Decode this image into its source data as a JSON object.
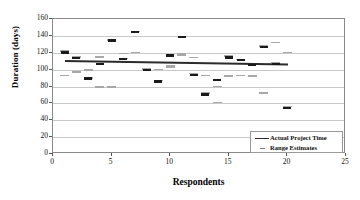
{
  "chart_data": {
    "type": "scatter",
    "title": "",
    "xlabel": "Respondents",
    "ylabel": "Duration (days)",
    "xlim": [
      0,
      25
    ],
    "ylim": [
      0,
      160
    ],
    "xticks": [
      0,
      5,
      10,
      15,
      20,
      25
    ],
    "yticks": [
      0,
      20,
      40,
      60,
      80,
      100,
      120,
      140,
      160
    ],
    "grid": "horizontal",
    "legend_position": "lower-right",
    "x": [
      1,
      2,
      3,
      4,
      5,
      6,
      7,
      8,
      9,
      10,
      11,
      12,
      13,
      14,
      15,
      16,
      17,
      18,
      19,
      20
    ],
    "series": [
      {
        "name": "Actual Project Time",
        "marker": "horizontal-dash-dark",
        "values": [
          121,
          114,
          90,
          107,
          135,
          113,
          145,
          100,
          86,
          117,
          139,
          94,
          71,
          88,
          115,
          112,
          106,
          127,
          107,
          55
        ]
      },
      {
        "name": "Range Estimates (upper)",
        "marker": "horizontal-dash-gray",
        "values": [
          122,
          115,
          99,
          115,
          135,
          119,
          145,
          101,
          100,
          104,
          118,
          114,
          93,
          80,
          116,
          112,
          106,
          128,
          132,
          120
        ]
      },
      {
        "name": "Range Estimates (lower)",
        "marker": "horizontal-dash-gray",
        "values": [
          93,
          97,
          90,
          79,
          79,
          113,
          120,
          100,
          87,
          103,
          117,
          95,
          72,
          61,
          92,
          93,
          92,
          72,
          108,
          56
        ]
      }
    ],
    "trendline": {
      "name": "Actual Project Time",
      "x_start": 1,
      "x_end": 20,
      "y_start": 112,
      "y_end": 108
    },
    "legend": [
      {
        "label": "Actual Project Time",
        "key": "solid-line"
      },
      {
        "label": "Range Estimates",
        "key": "dash"
      }
    ],
    "colors": {
      "actual": "#1a1a1a",
      "range": "#a8a8a8",
      "trend": "#2b2b2b",
      "grid": "#c8c8c8",
      "frame": "#8a8a8a"
    }
  }
}
